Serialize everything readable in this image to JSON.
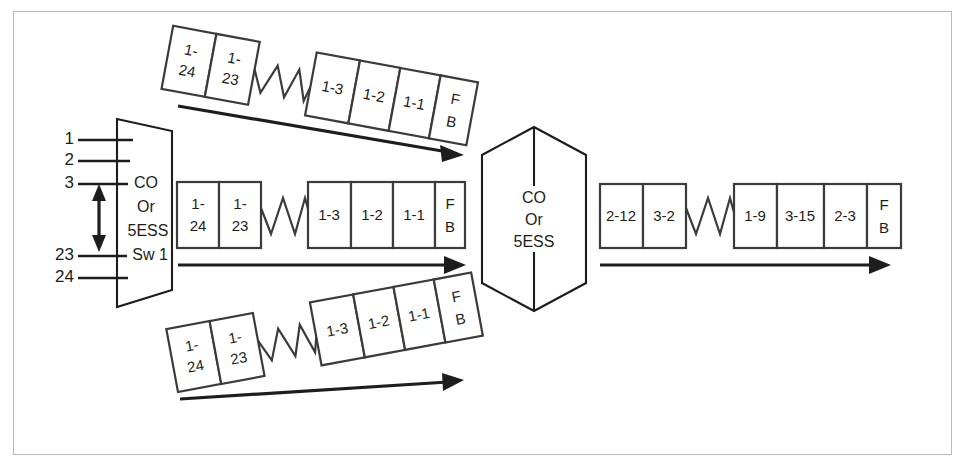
{
  "diagram": {
    "colors": {
      "ink": "#1d1d1b",
      "box_stroke": "#3b3b39",
      "frame_border": "#b9b9b9",
      "background": "#ffffff"
    },
    "left_node": {
      "shape": "trapezoid",
      "lines": [
        "CO",
        "Or",
        "5ESS",
        "Sw 1"
      ],
      "label": "CO Or 5ESS Sw 1"
    },
    "center_node": {
      "shape": "hexagon",
      "lines": [
        "CO",
        "Or",
        "5ESS"
      ],
      "label": "CO Or 5ESS"
    },
    "ports": {
      "labels": [
        "1",
        "2",
        "3",
        "23",
        "24"
      ],
      "range_arrow": "double-headed-vertical-arrow"
    },
    "frames": [
      {
        "id": "top-frame",
        "orientation": "tilted-down",
        "left_group": [
          "1-\n24",
          "1-\n23"
        ],
        "left_cells": [
          {
            "l1": "1-",
            "l2": "24"
          },
          {
            "l1": "1-",
            "l2": "23"
          }
        ],
        "separator": "zigzag",
        "right_cells": [
          {
            "l1": "1-3",
            "l2": ""
          },
          {
            "l1": "1-2",
            "l2": ""
          },
          {
            "l1": "1-1",
            "l2": ""
          },
          {
            "l1": "F",
            "l2": "B"
          }
        ],
        "arrow": "right"
      },
      {
        "id": "middle-frame",
        "orientation": "horizontal",
        "left_cells": [
          {
            "l1": "1-",
            "l2": "24"
          },
          {
            "l1": "1-",
            "l2": "23"
          }
        ],
        "separator": "zigzag",
        "right_cells": [
          {
            "l1": "1-3",
            "l2": ""
          },
          {
            "l1": "1-2",
            "l2": ""
          },
          {
            "l1": "1-1",
            "l2": ""
          },
          {
            "l1": "F",
            "l2": "B"
          }
        ],
        "arrow": "right"
      },
      {
        "id": "bottom-frame",
        "orientation": "tilted-up",
        "left_cells": [
          {
            "l1": "1-",
            "l2": "24"
          },
          {
            "l1": "1-",
            "l2": "23"
          }
        ],
        "separator": "zigzag",
        "right_cells": [
          {
            "l1": "1-3",
            "l2": ""
          },
          {
            "l1": "1-2",
            "l2": ""
          },
          {
            "l1": "1-1",
            "l2": ""
          },
          {
            "l1": "F",
            "l2": "B"
          }
        ],
        "arrow": "right"
      },
      {
        "id": "output-frame",
        "orientation": "horizontal",
        "left_cells": [
          {
            "l1": "2-12",
            "l2": ""
          },
          {
            "l1": "3-2",
            "l2": ""
          }
        ],
        "separator": "zigzag",
        "right_cells": [
          {
            "l1": "1-9",
            "l2": ""
          },
          {
            "l1": "3-15",
            "l2": ""
          },
          {
            "l1": "2-3",
            "l2": ""
          },
          {
            "l1": "F",
            "l2": "B"
          }
        ],
        "arrow": "right"
      }
    ]
  }
}
